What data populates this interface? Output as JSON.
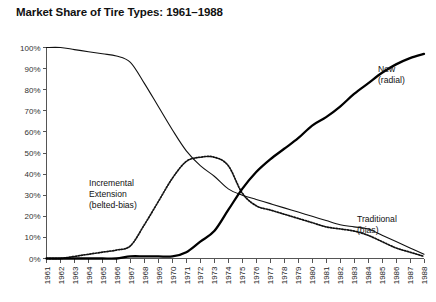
{
  "chart_data": {
    "type": "line",
    "title": "Market Share of Tire Types: 1961–1988",
    "xlabel": "",
    "ylabel": "",
    "ylim": [
      0,
      100
    ],
    "ytick_labels": [
      "0%",
      "10%",
      "20%",
      "30%",
      "40%",
      "50%",
      "60%",
      "70%",
      "80%",
      "90%",
      "100%"
    ],
    "ytick_values": [
      0,
      10,
      20,
      30,
      40,
      50,
      60,
      70,
      80,
      90,
      100
    ],
    "grid": false,
    "legend_position": "inline-annotations",
    "x": [
      1961,
      1962,
      1963,
      1964,
      1965,
      1966,
      1967,
      1968,
      1969,
      1970,
      1971,
      1972,
      1973,
      1974,
      1975,
      1976,
      1977,
      1978,
      1979,
      1980,
      1981,
      1982,
      1983,
      1984,
      1985,
      1986,
      1987,
      1988
    ],
    "categories": [
      "1961",
      "1962",
      "1963",
      "1964",
      "1965",
      "1966",
      "1967",
      "1968",
      "1969",
      "1970",
      "1971",
      "1972",
      "1973",
      "1974",
      "1975",
      "1976",
      "1977",
      "1978",
      "1979",
      "1980",
      "1981",
      "1982",
      "1983",
      "1984",
      "1985",
      "1986",
      "1987",
      "1988"
    ],
    "series": [
      {
        "name": "Traditional (bias)",
        "style": "solid-thin",
        "label_lines": [
          "Traditional",
          "(bias)"
        ],
        "values": [
          100,
          100,
          99,
          98,
          97,
          96,
          93,
          83,
          72,
          61,
          51,
          44,
          39,
          33,
          30,
          28,
          26,
          24,
          22,
          20,
          18,
          16,
          15,
          14,
          11,
          8,
          5,
          2
        ]
      },
      {
        "name": "Incremental Extension (belted-bias)",
        "style": "dotted",
        "label_lines": [
          "Incremental",
          "Extension",
          "(belted-bias)"
        ],
        "values": [
          0,
          0,
          1,
          2,
          3,
          4,
          6,
          16,
          27,
          38,
          46,
          48,
          48,
          44,
          31,
          25,
          23,
          21,
          19,
          17,
          15,
          14,
          13,
          11,
          8,
          5,
          3,
          1
        ]
      },
      {
        "name": "New (radial)",
        "style": "solid-thick",
        "label_lines": [
          "New",
          "(radial)"
        ],
        "values": [
          0,
          0,
          0,
          0,
          0,
          0,
          1,
          1,
          1,
          1,
          3,
          8,
          13,
          23,
          33,
          41,
          47,
          52,
          57,
          63,
          67,
          72,
          78,
          83,
          88,
          92,
          95,
          97
        ]
      }
    ],
    "annotations": [
      {
        "name": "new-radial-label",
        "lines": [
          "New",
          "(radial)"
        ],
        "x": 378,
        "y": 72
      },
      {
        "name": "incremental-extension-label",
        "lines": [
          "Incremental",
          "Extension",
          "(belted-bias)"
        ],
        "x": 89,
        "y": 186
      },
      {
        "name": "traditional-bias-label",
        "lines": [
          "Traditional",
          "(bias)"
        ],
        "x": 357,
        "y": 222
      }
    ]
  }
}
